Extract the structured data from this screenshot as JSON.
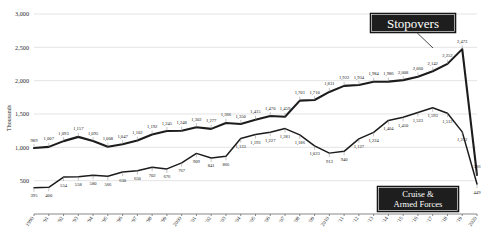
{
  "chart_data": {
    "type": "line",
    "title": "",
    "xlabel": "",
    "ylabel": "Thousands",
    "ylim": [
      0,
      3000
    ],
    "ytick_labels": [
      "3,000",
      "2,500",
      "2,000",
      "1,500",
      "1,000",
      "500"
    ],
    "ytick_values": [
      3000,
      2500,
      2000,
      1500,
      1000,
      500
    ],
    "grid": true,
    "legend_position": "annotation-callouts",
    "x": [
      "1990",
      "'91",
      "'92",
      "'93",
      "'94",
      "'95",
      "'96",
      "'97",
      "'98",
      "'99",
      "2000",
      "'01",
      "'02",
      "'03",
      "'04",
      "'05",
      "'06",
      "'07",
      "'08",
      "'09",
      "2010",
      "'11",
      "'12",
      "'13",
      "'14",
      "'15",
      "'16",
      "'17",
      "'18",
      "'19",
      "2020"
    ],
    "series": [
      {
        "name": "Stopovers",
        "values": [
          989,
          1007,
          1093,
          1157,
          1095,
          1008,
          1047,
          1102,
          1192,
          1245,
          1248,
          1302,
          1277,
          1366,
          1350,
          1415,
          1470,
          1459,
          1701,
          1710,
          1831,
          1922,
          1934,
          1984,
          1986,
          2008,
          2060,
          2142,
          2252,
          2473,
          586
        ],
        "labels": [
          "989",
          "1,007",
          "1,093",
          "1,157",
          "1,095",
          "1,008",
          "1,047",
          "1,102",
          "1,192",
          "1,245",
          "1,248",
          "1,302",
          "1,277",
          "1,366",
          "1,350",
          "1,415",
          "1,470",
          "1,459",
          "1,701",
          "1,710",
          "1,831",
          "1,922",
          "1,934",
          "1,984",
          "1,986",
          "2,008",
          "2,060",
          "2,142",
          "2,252",
          "2,473",
          "586"
        ]
      },
      {
        "name": "Cruise & Armed Forces",
        "values": [
          395,
          400,
          554,
          558,
          580,
          566,
          630,
          650,
          702,
          676,
          767,
          909,
          841,
          866,
          1133,
          1193,
          1227,
          1281,
          1186,
          1023,
          913,
          940,
          1127,
          1224,
          1404,
          1450,
          1523,
          1593,
          1512,
          1232,
          449
        ],
        "labels": [
          "395",
          "400",
          "554",
          "558",
          "580",
          "566",
          "630",
          "650",
          "702",
          "676",
          "767",
          "909",
          "841",
          "866",
          "1,133",
          "1,193",
          "1,227",
          "1,281",
          "1,186",
          "1,023",
          "913",
          "940",
          "1,127",
          "1,224",
          "1,404",
          "1,450",
          "1,523",
          "1,593",
          "1,512",
          "1,232",
          "449"
        ]
      }
    ],
    "annotations": [
      {
        "name": "stopovers-callout",
        "text": "Stopovers"
      },
      {
        "name": "cruise-callout",
        "line1": "Cruise &",
        "line2": "Armed Forces"
      }
    ]
  }
}
